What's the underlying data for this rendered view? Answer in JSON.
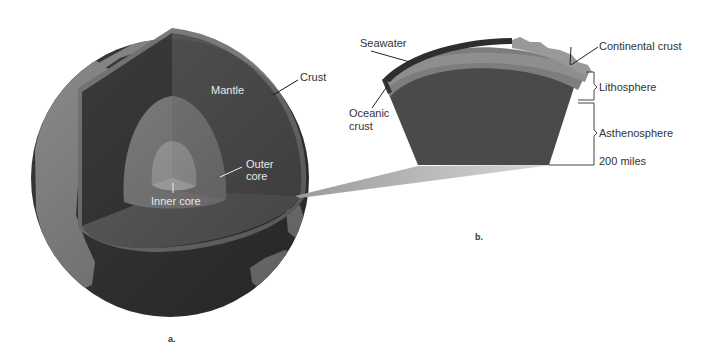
{
  "figure": {
    "panels": [
      {
        "id": "a",
        "caption": "a.",
        "title": "Earth cutaway",
        "labels": {
          "mantle": "Mantle",
          "crust": "Crust",
          "outer_core": "Outer core",
          "outer_core_line1": "Outer",
          "outer_core_line2": "core",
          "inner_core": "Inner core"
        }
      },
      {
        "id": "b",
        "caption": "b.",
        "title": "Crust and upper mantle section",
        "labels": {
          "seawater": "Seawater",
          "continental_crust": "Continental crust",
          "oceanic_crust_line1": "Oceanic",
          "oceanic_crust_line2": "crust",
          "lithosphere": "Lithosphere",
          "asthenosphere": "Asthenosphere",
          "depth": "200 miles"
        }
      }
    ],
    "colors": {
      "background": "#ffffff",
      "ocean": "#3a3a3a",
      "land": "#8c8c8c",
      "crust_rim": "#7a7a7a",
      "mantle_dark": "#3c3c3c",
      "mantle": "#555555",
      "outer_core": "#868686",
      "inner_core": "#a8a8a8",
      "lithosphere": "#7d7d7d",
      "continental_crust": "#8e8e8e",
      "asthenosphere": "#4a4a4a",
      "seawater": "#2e2e2e",
      "label_text": "#333333",
      "label_text_light": "#e8e8e8"
    }
  }
}
